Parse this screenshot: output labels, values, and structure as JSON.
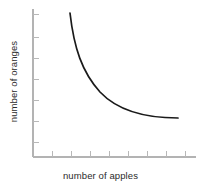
{
  "figure": {
    "name": "apples-oranges-tradeoff-curve",
    "background_color": "#ffffff",
    "axis_color": "#b3b3b3",
    "curve_color": "#1a1a1a",
    "label_color": "#2b2b2b"
  },
  "axes": {
    "x_label": "number of apples",
    "y_label": "number of oranges"
  },
  "chart_data": {
    "type": "line",
    "title": "",
    "xlabel": "number of apples",
    "ylabel": "number of oranges",
    "xlim": [
      0,
      10
    ],
    "ylim": [
      0,
      10
    ],
    "grid": false,
    "legend": false,
    "x_tick_labels": [],
    "y_tick_labels": [],
    "x_tick_count": 9,
    "y_tick_count": 7,
    "series": [
      {
        "name": "tradeoff-curve",
        "color": "#1a1a1a",
        "x": [
          2.0,
          2.3,
          2.7,
          3.2,
          3.8,
          4.5,
          5.3,
          6.2,
          7.2,
          8.3,
          9.3
        ],
        "y": [
          9.5,
          8.3,
          7.1,
          6.0,
          5.0,
          4.2,
          3.5,
          3.0,
          2.6,
          2.35,
          2.25
        ]
      }
    ]
  },
  "curve_geometry": {
    "path": "M 70,13 C 74,48 82,72 100,92 C 118,111 145,118 178,118",
    "stroke_width": 1.7
  },
  "axis_geometry": {
    "y_axis": {
      "x": 33,
      "y_top": 9,
      "y_bottom": 157
    },
    "x_axis": {
      "y": 157,
      "x_left": 33,
      "x_right": 196
    },
    "y_ticks": [
      14,
      37,
      58,
      79,
      100,
      121,
      142
    ],
    "x_ticks": [
      52,
      71,
      90,
      109,
      128,
      147,
      166,
      185
    ],
    "tick_length": 6,
    "tick_width": 1
  }
}
